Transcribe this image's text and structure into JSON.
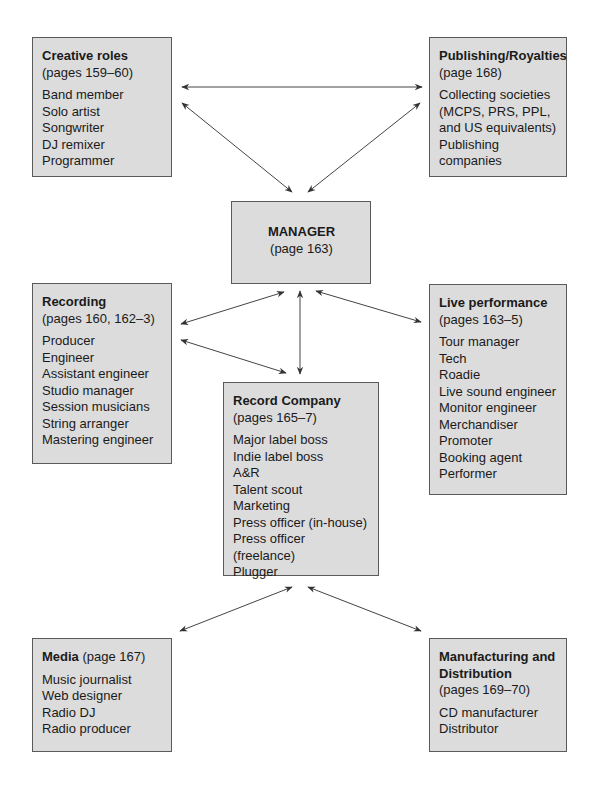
{
  "diagram": {
    "nodes": {
      "creative": {
        "title": "Creative roles",
        "pages": "(pages 159–60)",
        "items": [
          "Band member",
          "Solo artist",
          "Songwriter",
          "DJ remixer",
          "Programmer"
        ]
      },
      "publishing": {
        "title": "Publishing/Royalties",
        "pages": "(page 168)",
        "items": [
          "Collecting societies",
          "(MCPS, PRS, PPL,",
          "and US equivalents)",
          "Publishing companies"
        ]
      },
      "manager": {
        "title": "MANAGER",
        "pages": "(page 163)"
      },
      "recording": {
        "title": "Recording",
        "pages": "(pages 160, 162–3)",
        "items": [
          "Producer",
          "Engineer",
          "Assistant engineer",
          "Studio manager",
          "Session musicians",
          "String arranger",
          "Mastering engineer"
        ]
      },
      "live": {
        "title": "Live performance",
        "pages": "(pages 163–5)",
        "items": [
          "Tour manager",
          "Tech",
          "Roadie",
          "Live sound engineer",
          "Monitor engineer",
          "Merchandiser",
          "Promoter",
          "Booking agent",
          "Performer"
        ]
      },
      "record_company": {
        "title": "Record Company",
        "pages": "(pages 165–7)",
        "items": [
          "Major label boss",
          "Indie label boss",
          "A&R",
          "Talent scout",
          "Marketing",
          "Press officer (in-house)",
          "Press officer (freelance)",
          "Plugger"
        ]
      },
      "media": {
        "title": "Media",
        "pages": "(page 167)",
        "items": [
          "Music journalist",
          "Web designer",
          "Radio DJ",
          "Radio producer"
        ]
      },
      "manufacturing": {
        "title_line1": "Manufacturing and",
        "title_line2": "Distribution",
        "pages": "(pages 169–70)",
        "items": [
          "CD manufacturer",
          "Distributor"
        ]
      }
    },
    "edges": [
      {
        "from": "creative",
        "to": "publishing",
        "direction": "both"
      },
      {
        "from": "creative",
        "to": "manager",
        "direction": "both"
      },
      {
        "from": "publishing",
        "to": "manager",
        "direction": "both"
      },
      {
        "from": "manager",
        "to": "recording",
        "direction": "both"
      },
      {
        "from": "manager",
        "to": "live",
        "direction": "both"
      },
      {
        "from": "manager",
        "to": "record_company",
        "direction": "both"
      },
      {
        "from": "recording",
        "to": "record_company",
        "direction": "both"
      },
      {
        "from": "record_company",
        "to": "media",
        "direction": "both"
      },
      {
        "from": "record_company",
        "to": "manufacturing",
        "direction": "both"
      }
    ],
    "colors": {
      "box_fill": "#dcdcdc",
      "box_border": "#5a5a5a",
      "arrow": "#333333"
    }
  }
}
